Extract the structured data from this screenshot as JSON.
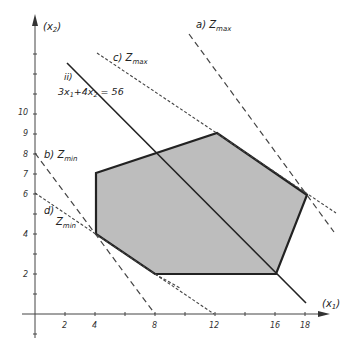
{
  "axes": {
    "x_label": "(x",
    "x_sub": "1",
    "x_close": ")",
    "y_label": "(x",
    "y_sub": "2",
    "y_close": ")",
    "x_ticks": [
      "2",
      "4",
      "8",
      "12",
      "16",
      "18"
    ],
    "y_ticks": [
      "2",
      "4",
      "6",
      "7",
      "8",
      "9",
      "10"
    ]
  },
  "labels": {
    "a": {
      "prefix": "a) Z",
      "sub": "max"
    },
    "b": {
      "prefix": "b) Z",
      "sub": "min"
    },
    "c": {
      "prefix": "c) Z",
      "sub": "max"
    },
    "d_prefix": "d)",
    "d": {
      "prefix": "Z",
      "sub": "min"
    },
    "ii_prefix": "ii)",
    "constraint": {
      "part1": "3x",
      "s1": "1",
      "part2": "+4x",
      "s2": "2",
      "part3": " = 56"
    }
  },
  "feasible_region": {
    "vertices": [
      [
        4,
        7
      ],
      [
        12,
        9
      ],
      [
        18,
        6
      ],
      [
        16,
        2
      ],
      [
        8,
        2
      ],
      [
        4,
        4
      ]
    ],
    "fill": "#bdbdbd"
  },
  "lines": [
    {
      "name": "a) Zmax",
      "style": "dashed"
    },
    {
      "name": "b) Zmin",
      "style": "dashed"
    },
    {
      "name": "c) Zmax",
      "style": "dotted"
    },
    {
      "name": "d) Zmin",
      "style": "dotted"
    },
    {
      "name": "ii) 3x1+4x2 = 56",
      "style": "solid"
    }
  ]
}
